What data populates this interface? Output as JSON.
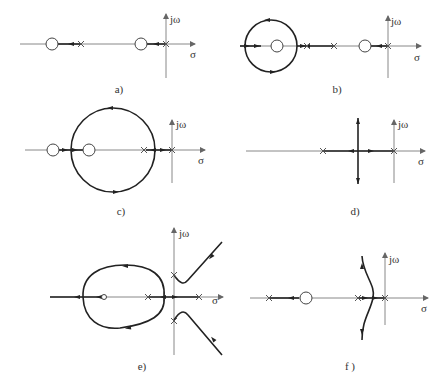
{
  "figure": {
    "axis_labels": {
      "imag": "jω",
      "real": "σ"
    },
    "panels": [
      {
        "id": "a",
        "caption": "a)",
        "description": "Two poles, two zeros on real axis; locus segments on real axis from poles to zeros"
      },
      {
        "id": "b",
        "caption": "b)",
        "description": "Circular locus around a zero with branches on real axis"
      },
      {
        "id": "c",
        "caption": "c)",
        "description": "Large circular locus enclosing a zero, breaking away near origin"
      },
      {
        "id": "d",
        "caption": "d)",
        "description": "Two poles meeting at breakaway point, branches going vertically"
      },
      {
        "id": "e",
        "caption": "e)",
        "description": "Teardrop loop around a zero plus asymptotic branches from complex poles"
      },
      {
        "id": "f",
        "caption": "f )",
        "description": "S-shaped branches leaving the real axis near origin"
      }
    ]
  }
}
